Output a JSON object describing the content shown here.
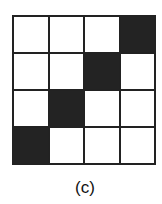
{
  "figure": {
    "label": "(c)",
    "rows": 4,
    "cols": 4,
    "cells": [
      [
        0,
        0,
        0,
        1
      ],
      [
        0,
        0,
        1,
        0
      ],
      [
        0,
        1,
        0,
        0
      ],
      [
        1,
        0,
        0,
        0
      ]
    ],
    "filled_color": "#232323",
    "empty_color": "#ffffff"
  }
}
